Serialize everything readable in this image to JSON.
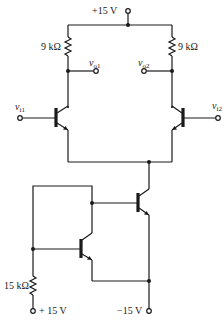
{
  "diagram": {
    "type": "circuit-schematic",
    "supplies": {
      "top": "+15 V",
      "bottom_left": "+ 15 V",
      "bottom_right": "−15 V"
    },
    "resistors": {
      "r_left_collector": "9 kΩ",
      "r_right_collector": "9 kΩ",
      "r_bias": "15 kΩ"
    },
    "terminals": {
      "vi1": {
        "base": "v",
        "sub": "i1"
      },
      "vi2": {
        "base": "v",
        "sub": "i2"
      },
      "vo1": {
        "base": "v",
        "sub": "o1"
      },
      "vo2": {
        "base": "v",
        "sub": "o2"
      }
    },
    "transistors": [
      "Q1 (npn, left input)",
      "Q2 (npn, right input)",
      "Q3 (npn, tail current source)",
      "Q4 (npn, diode-connected mirror)"
    ],
    "colors": {
      "line": "#1a1a1a",
      "background": "#ffffff"
    }
  }
}
